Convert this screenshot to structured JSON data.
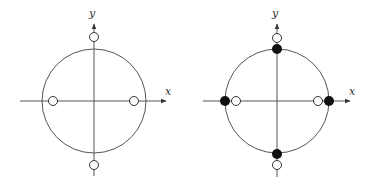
{
  "colors": {
    "line": "#555555",
    "stroke": "#333333",
    "fill_dark": "#111111",
    "background": "#ffffff"
  },
  "diagrams": [
    {
      "id": "left",
      "x_label": "x",
      "y_label": "y",
      "center": [
        94,
        101
      ],
      "radius": 52,
      "open_points": [
        [
          53,
          101
        ],
        [
          134,
          101
        ],
        [
          94,
          37
        ],
        [
          94,
          165
        ]
      ],
      "filled_points": []
    },
    {
      "id": "right",
      "x_label": "x",
      "y_label": "y",
      "center": [
        277,
        101
      ],
      "radius": 52,
      "open_points": [
        [
          236,
          101
        ],
        [
          318,
          101
        ],
        [
          277,
          38
        ],
        [
          277,
          165
        ]
      ],
      "filled_points": [
        [
          225,
          101
        ],
        [
          329,
          101
        ],
        [
          277,
          49
        ],
        [
          277,
          154
        ]
      ]
    }
  ]
}
